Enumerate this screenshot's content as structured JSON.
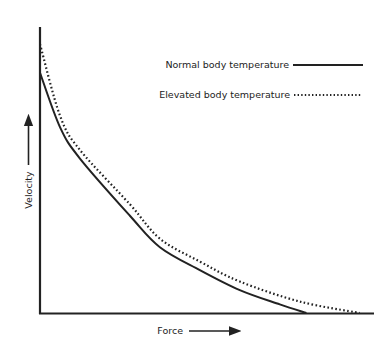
{
  "chart_data": {
    "type": "line",
    "title": "",
    "xlabel": "Force",
    "ylabel": "Velocity",
    "x_ticks": [],
    "y_ticks": [],
    "grid": false,
    "legend_position": "upper right",
    "xlim": [
      0,
      1
    ],
    "ylim": [
      0,
      1
    ],
    "series": [
      {
        "name": "Normal body temperature",
        "style": "solid",
        "color": "#222222",
        "x": [
          0.0,
          0.06,
          0.12,
          0.27,
          0.36,
          0.48,
          0.6,
          0.72,
          0.8
        ],
        "y": [
          0.84,
          0.65,
          0.54,
          0.34,
          0.23,
          0.15,
          0.08,
          0.03,
          0.0
        ]
      },
      {
        "name": "Elevated body temperature",
        "style": "dotted",
        "color": "#222222",
        "x": [
          0.0,
          0.06,
          0.12,
          0.27,
          0.36,
          0.48,
          0.6,
          0.78,
          0.96
        ],
        "y": [
          0.94,
          0.69,
          0.57,
          0.38,
          0.26,
          0.18,
          0.11,
          0.04,
          0.0
        ]
      }
    ]
  },
  "legend": {
    "items": [
      {
        "label": "Normal body temperature",
        "style": "solid"
      },
      {
        "label": "Elevated body temperature",
        "style": "dotted"
      }
    ]
  },
  "axes": {
    "x_label": "Force",
    "y_label": "Velocity"
  }
}
